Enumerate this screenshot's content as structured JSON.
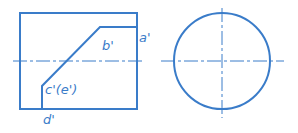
{
  "diagram": {
    "type": "orthographic projection",
    "color": "#3a7cc9",
    "front_view": {
      "labels": {
        "a": "a'",
        "b": "b'",
        "ce": "c'(e')",
        "d": "d'"
      }
    },
    "side_view": {
      "shape": "circle"
    }
  }
}
